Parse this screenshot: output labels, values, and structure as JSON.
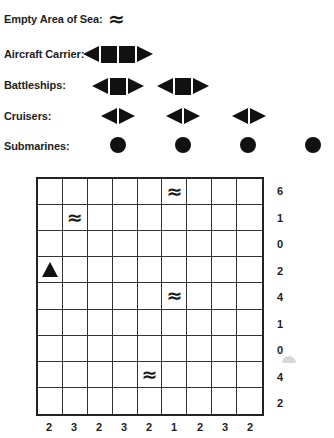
{
  "legend": {
    "empty_sea_label": "Empty Area of Sea:",
    "empty_sea_symbol": "≈",
    "aircraft_carrier_label": "Aircraft Carrier:",
    "battleships_label": "Battleships:",
    "cruisers_label": "Cruisers:",
    "submarines_label": "Submarines:",
    "counts": {
      "aircraft_carrier": 1,
      "battleships": 2,
      "cruisers": 3,
      "submarines": 4
    }
  },
  "grid": {
    "rows": 9,
    "cols": 9,
    "row_clues": [
      "6",
      "1",
      "0",
      "2",
      "4",
      "1",
      "0",
      "4",
      "2"
    ],
    "col_clues": [
      "2",
      "3",
      "2",
      "3",
      "2",
      "1",
      "2",
      "3",
      "2"
    ],
    "given_cells": [
      {
        "row": 0,
        "col": 5,
        "type": "water",
        "symbol": "≈"
      },
      {
        "row": 1,
        "col": 1,
        "type": "water",
        "symbol": "≈"
      },
      {
        "row": 3,
        "col": 0,
        "type": "ship-end-up",
        "symbol": "▲"
      },
      {
        "row": 4,
        "col": 5,
        "type": "water",
        "symbol": "≈"
      },
      {
        "row": 7,
        "col": 4,
        "type": "water",
        "symbol": "≈"
      }
    ]
  }
}
